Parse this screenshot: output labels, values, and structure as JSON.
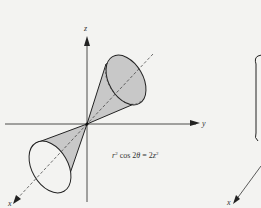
{
  "figure": {
    "axes": {
      "z_label": "z",
      "y_label": "y",
      "x_label": "x"
    },
    "equation": {
      "text": "r² cos 2θ = 2z²",
      "r": "r",
      "sup1": "2",
      "cos": " cos 2",
      "theta": "θ",
      "eq": " = 2",
      "z": "z",
      "sup2": "2"
    },
    "second_figure": {
      "x_label": "x"
    },
    "colors": {
      "background": "#f3f3f1",
      "cone_fill": "#c8c8c8",
      "stroke": "#222222"
    }
  }
}
